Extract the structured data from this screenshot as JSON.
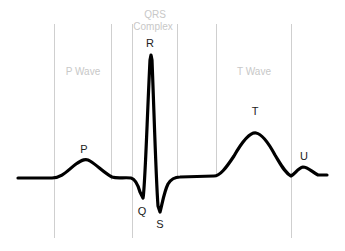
{
  "diagram": {
    "regions": {
      "p_wave": "P Wave",
      "qrs_line1": "QRS",
      "qrs_line2": "Complex",
      "t_wave": "T Wave"
    },
    "points": {
      "p": "P",
      "q": "Q",
      "r": "R",
      "s": "S",
      "t": "T",
      "u": "U"
    },
    "colors": {
      "trace": "#000000",
      "divider": "#cfcfcf",
      "region_label": "#c8c8c8",
      "point_label": "#222222"
    }
  }
}
